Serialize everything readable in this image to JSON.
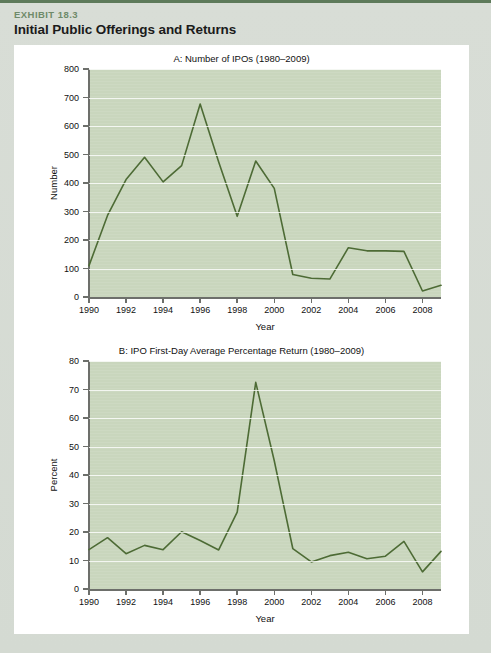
{
  "exhibit": {
    "kicker": "EXHIBIT 18.3",
    "title": "Initial Public Offerings and Returns"
  },
  "theme": {
    "accent_green": "#5d7a5a",
    "kicker_green": "#6e8a69",
    "plot_background": "#c9d6bd",
    "line_color": "#4d6b35",
    "gridline_color": "#ffffff",
    "axis_color": "#6d6f6b",
    "card_background": "#ffffff",
    "page_background": "#d8ddd6"
  },
  "chart_data": [
    {
      "id": "chart-a",
      "type": "line",
      "title": "A: Number of IPOs (1980–2009)",
      "xlabel": "Year",
      "ylabel": "Number",
      "xlim": [
        1990,
        2009
      ],
      "ylim": [
        0,
        800
      ],
      "ytick_values": [
        0,
        100,
        200,
        300,
        400,
        500,
        600,
        700,
        800
      ],
      "ytick_labels": [
        "0",
        "100",
        "200",
        "300",
        "400",
        "500",
        "600",
        "700",
        "800"
      ],
      "xtick_values": [
        1990,
        1992,
        1994,
        1996,
        1998,
        2000,
        2002,
        2004,
        2006,
        2008
      ],
      "xtick_labels": [
        "1990",
        "1992",
        "1994",
        "1996",
        "1998",
        "2000",
        "2002",
        "2004",
        "2006",
        "2008"
      ],
      "grid": true,
      "legend": "none",
      "x": [
        1990,
        1991,
        1992,
        1993,
        1994,
        1995,
        1996,
        1997,
        1998,
        1999,
        2000,
        2001,
        2002,
        2003,
        2004,
        2005,
        2006,
        2007,
        2008,
        2009
      ],
      "values": [
        110,
        286,
        412,
        490,
        404,
        461,
        677,
        474,
        283,
        477,
        381,
        79,
        66,
        63,
        173,
        162,
        162,
        160,
        21,
        41
      ]
    },
    {
      "id": "chart-b",
      "type": "line",
      "title": "B: IPO First-Day Average Percentage Return (1980–2009)",
      "xlabel": "Year",
      "ylabel": "Percent",
      "xlim": [
        1990,
        2009
      ],
      "ylim": [
        0,
        80
      ],
      "ytick_values": [
        0,
        10,
        20,
        30,
        40,
        50,
        60,
        70,
        80
      ],
      "ytick_labels": [
        "0",
        "10",
        "20",
        "30",
        "40",
        "50",
        "60",
        "70",
        "80"
      ],
      "xtick_values": [
        1990,
        1992,
        1994,
        1996,
        1998,
        2000,
        2002,
        2004,
        2006,
        2008
      ],
      "xtick_labels": [
        "1990",
        "1992",
        "1994",
        "1996",
        "1998",
        "2000",
        "2002",
        "2004",
        "2006",
        "2008"
      ],
      "grid": true,
      "legend": "none",
      "x": [
        1990,
        1991,
        1992,
        1993,
        1994,
        1995,
        1996,
        1997,
        1998,
        1999,
        2000,
        2001,
        2002,
        2003,
        2004,
        2005,
        2006,
        2007,
        2008,
        2009
      ],
      "values": [
        13.8,
        18.0,
        12.4,
        15.3,
        13.8,
        20.1,
        17.0,
        13.7,
        27.0,
        72.5,
        45.0,
        14.2,
        9.5,
        11.7,
        12.9,
        10.6,
        11.5,
        16.7,
        6.0,
        13.2
      ]
    }
  ]
}
